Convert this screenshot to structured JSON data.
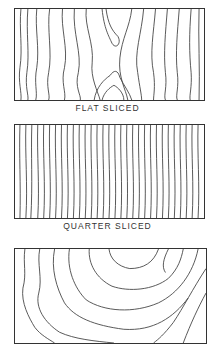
{
  "figures": [
    {
      "id": "flat",
      "caption": "FLAT SLICED",
      "pattern": "cathedral-grain"
    },
    {
      "id": "quarter",
      "caption": "QUARTER SLICED",
      "pattern": "straight-stripe-grain"
    },
    {
      "id": "rotary",
      "caption": "",
      "pattern": "wide-wavy-grain"
    }
  ]
}
